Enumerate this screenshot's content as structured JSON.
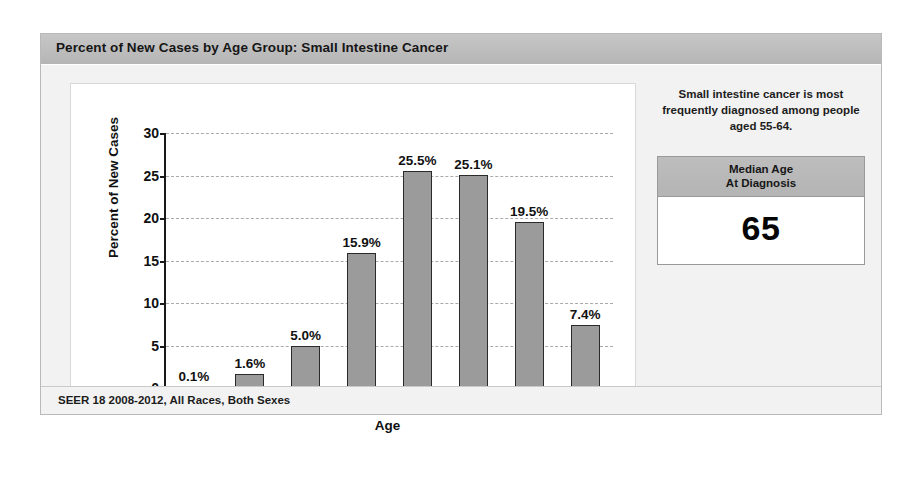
{
  "card": {
    "title": "Percent of New Cases by Age Group: Small Intestine Cancer",
    "footer": "SEER 18 2008-2012, All Races, Both Sexes"
  },
  "side_panel": {
    "note": "Small intestine cancer is most frequently diagnosed among people aged 55-64.",
    "median_box": {
      "heading_line1": "Median Age",
      "heading_line2": "At Diagnosis",
      "value": "65"
    }
  },
  "chart_data": {
    "type": "bar",
    "title": "Percent of New Cases by Age Group: Small Intestine Cancer",
    "xlabel": "Age",
    "ylabel": "Percent of New Cases",
    "categories": [
      "<20",
      "20-34",
      "35-44",
      "45-54",
      "55-64",
      "65-74",
      "75-84",
      ">84"
    ],
    "values": [
      0.1,
      1.6,
      5.0,
      15.9,
      25.5,
      25.1,
      19.5,
      7.4
    ],
    "data_labels": [
      "0.1%",
      "1.6%",
      "5.0%",
      "15.9%",
      "25.5%",
      "25.1%",
      "19.5%",
      "7.4%"
    ],
    "ylim": [
      0,
      30
    ],
    "yticks": [
      0,
      5,
      10,
      15,
      20,
      25,
      30
    ],
    "ytick_labels": [
      "0",
      "5",
      "10",
      "15",
      "20",
      "25",
      "30"
    ],
    "grid": true,
    "grid_style": "dashed-horizontal",
    "legend": null,
    "bar_color": "#9b9b9b",
    "bar_edge_color": "#2a2a2a"
  },
  "colors": {
    "header_bar": "#bdbdbd",
    "card_background": "#f2f2f2",
    "plot_background": "#ffffff",
    "axis": "#1a1a1a"
  }
}
